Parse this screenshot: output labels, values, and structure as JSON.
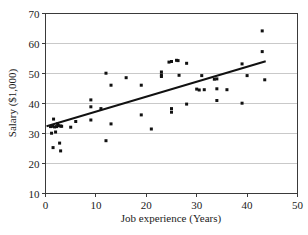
{
  "chart_data": {
    "type": "scatter",
    "title": "",
    "xlabel": "Job experience (Years)",
    "ylabel": "Salary ($1,000)",
    "xlim": [
      0,
      50
    ],
    "ylim": [
      10,
      70
    ],
    "xticks": [
      0,
      10,
      20,
      30,
      40,
      50
    ],
    "xtick_labels": [
      "0",
      "10",
      "20",
      "30",
      "40",
      "50"
    ],
    "yticks": [
      10,
      20,
      30,
      40,
      50,
      60,
      70
    ],
    "ytick_labels": [
      "10",
      "20",
      "30",
      "40",
      "50",
      "60",
      "70"
    ],
    "grid": "horizontal",
    "legend": "none",
    "marker": "square",
    "marker_color": "#111111",
    "series": [
      {
        "name": "Employees",
        "x": [
          1.0,
          1.2,
          1.4,
          1.5,
          1.6,
          1.8,
          2.0,
          2.2,
          2.4,
          2.6,
          2.8,
          3.0,
          3.0,
          3.2,
          5.0,
          6.0,
          9.0,
          9.0,
          9.0,
          11.0,
          12.0,
          12.0,
          13.0,
          13.0,
          16.0,
          19.0,
          19.0,
          21.0,
          23.0,
          23.0,
          23.0,
          24.5,
          25.0,
          25.0,
          25.0,
          26.0,
          26.3,
          26.5,
          28.0,
          28.0,
          30.0,
          30.5,
          31.0,
          31.5,
          33.5,
          34.0,
          34.0,
          34.0,
          36.0,
          39.0,
          39.0,
          40.0,
          43.0,
          43.0,
          43.5
        ],
        "y": [
          32.3,
          30.1,
          32.4,
          25.3,
          34.8,
          32.2,
          30.5,
          32.3,
          33.2,
          32.6,
          26.8,
          32.5,
          24.2,
          32.4,
          32.1,
          34.0,
          41.2,
          38.9,
          34.5,
          38.3,
          50.1,
          27.6,
          46.1,
          33.2,
          48.6,
          46.1,
          36.2,
          31.5,
          49.5,
          49.0,
          50.5,
          53.8,
          54.0,
          38.3,
          37.1,
          54.4,
          54.3,
          49.4,
          53.4,
          39.8,
          44.8,
          44.5,
          49.3,
          44.6,
          48.1,
          44.9,
          41.0,
          48.2,
          44.6,
          53.2,
          40.1,
          49.3,
          64.2,
          57.3,
          47.9
        ]
      }
    ],
    "trendline": {
      "name": "Least-squares regression line",
      "x_start": 0.4,
      "y_start": 32.5,
      "x_end": 43.5,
      "y_end": 54.0
    }
  }
}
